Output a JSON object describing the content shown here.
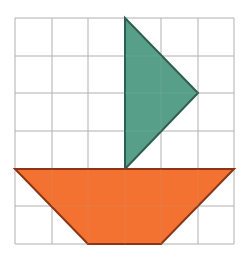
{
  "diagram": {
    "grid": {
      "columns": 6,
      "rows": 6,
      "line_color": "#b0b0b0"
    },
    "shapes": [
      {
        "name": "sail",
        "type": "right-triangle",
        "fill": "#4f9a84",
        "stroke": "#2e5e4f",
        "grid_points": [
          [
            3,
            0
          ],
          [
            5,
            2
          ],
          [
            3,
            4
          ]
        ]
      },
      {
        "name": "hull",
        "type": "trapezoid",
        "fill": "#f26a26",
        "stroke": "#8a3515",
        "grid_points": [
          [
            0,
            4
          ],
          [
            6,
            4
          ],
          [
            4,
            6
          ],
          [
            2,
            6
          ]
        ]
      }
    ]
  }
}
